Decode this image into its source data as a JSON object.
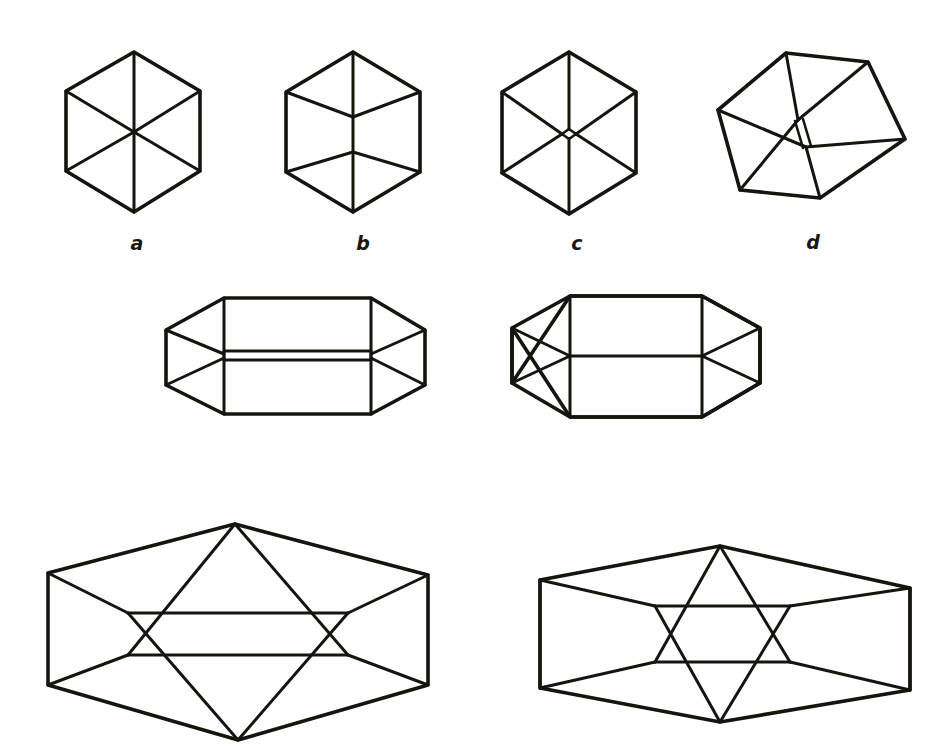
{
  "figure": {
    "kind": "line-drawing-plate",
    "background_color": "#ffffff",
    "ink_color": "#16140f",
    "width": 950,
    "height": 753
  },
  "labels": [
    {
      "id": "label-a",
      "text": "a",
      "x": 137,
      "y": 243
    },
    {
      "id": "label-b",
      "text": "b",
      "x": 363,
      "y": 243
    },
    {
      "id": "label-c",
      "text": "c",
      "x": 577,
      "y": 243
    },
    {
      "id": "label-d",
      "text": "d",
      "x": 813,
      "y": 242
    }
  ],
  "panels": [
    {
      "id": "panel-a",
      "label": "a",
      "caption": "Regular hexagon with three full internal radii meeting at a single centre point (classic Necker cube projection)",
      "center": [
        134,
        132
      ],
      "vertices": [
        [
          134,
          52
        ],
        [
          200,
          91
        ],
        [
          200,
          171
        ],
        [
          134,
          212
        ],
        [
          66,
          171
        ],
        [
          66,
          91
        ]
      ],
      "internal_point": [
        134,
        132
      ]
    },
    {
      "id": "panel-b",
      "label": "b",
      "caption": "Hexagon whose centre is split into a short vertical segment joining two Y junctions",
      "center": [
        353,
        133
      ],
      "vertices": [
        [
          353,
          52
        ],
        [
          420,
          92
        ],
        [
          420,
          172
        ],
        [
          353,
          212
        ],
        [
          286,
          172
        ],
        [
          286,
          92
        ]
      ],
      "split_top": [
        353,
        117
      ],
      "split_bottom": [
        353,
        152
      ]
    },
    {
      "id": "panel-c",
      "label": "c",
      "caption": "Hexagon with a small rhombic hole at the centre where the three radii would meet",
      "center": [
        569,
        134
      ],
      "vertices": [
        [
          569,
          52
        ],
        [
          636,
          92
        ],
        [
          636,
          173
        ],
        [
          569,
          214
        ],
        [
          502,
          173
        ],
        [
          502,
          92
        ]
      ],
      "hole": {
        "half_width": 7,
        "half_height": 5
      }
    },
    {
      "id": "panel-d",
      "label": "d",
      "caption": "Tilted hexagon with an elongated slot-shaped gap at the centre",
      "center": [
        800,
        133
      ],
      "rotation_deg": -14,
      "vertices": [
        [
          786,
          53
        ],
        [
          868,
          62
        ],
        [
          905,
          139
        ],
        [
          820,
          198
        ],
        [
          740,
          190
        ],
        [
          718,
          110
        ]
      ],
      "slot_top": [
        798,
        120
      ],
      "slot_bottom": [
        806,
        147
      ]
    },
    {
      "id": "panel-e",
      "label": "",
      "caption": "Wide flattened hexagonal prism with a narrow double-line band across the middle",
      "center": [
        295,
        358
      ],
      "outline": [
        [
          224,
          298
        ],
        [
          371,
          298
        ],
        [
          425,
          330
        ],
        [
          425,
          385
        ],
        [
          371,
          414
        ],
        [
          224,
          414
        ],
        [
          166,
          385
        ],
        [
          166,
          330
        ]
      ],
      "band_top_y": 351,
      "band_bottom_y": 360
    },
    {
      "id": "panel-f",
      "label": "",
      "caption": "Wide flattened hexagonal prism with a single horizontal line across the middle",
      "center": [
        635,
        356
      ],
      "outline": [
        [
          570,
          296
        ],
        [
          702,
          296
        ],
        [
          760,
          328
        ],
        [
          760,
          383
        ],
        [
          702,
          417
        ],
        [
          570,
          417
        ],
        [
          512,
          383
        ],
        [
          512,
          328
        ]
      ],
      "mid_y": 356
    },
    {
      "id": "panel-g",
      "label": "",
      "caption": "Large wide hexagon containing an interlocking pair of triangles (partial star) with a separated centre band",
      "center": [
        238,
        630
      ],
      "outline": [
        [
          48,
          573
        ],
        [
          235,
          524
        ],
        [
          428,
          575
        ],
        [
          428,
          685
        ],
        [
          238,
          740
        ],
        [
          48,
          685
        ]
      ],
      "inner_band_top_y": 613,
      "inner_band_bottom_y": 655,
      "inner_band_left_x": 128,
      "inner_band_right_x": 348
    },
    {
      "id": "panel-h",
      "label": "",
      "caption": "Large wide hexagon containing a complete six-pointed star (Star of David) figure",
      "center": [
        720,
        634
      ],
      "outline": [
        [
          540,
          580
        ],
        [
          720,
          546
        ],
        [
          910,
          588
        ],
        [
          910,
          690
        ],
        [
          720,
          722
        ],
        [
          540,
          688
        ]
      ],
      "star_top_y": 606,
      "star_bottom_y": 662,
      "star_left_x": 655,
      "star_right_x": 790
    }
  ]
}
